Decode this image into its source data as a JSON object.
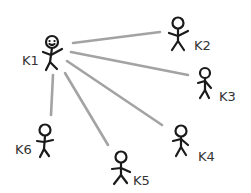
{
  "diagram": {
    "type": "star-network",
    "center_node": "K1",
    "colors": {
      "edge": "#9a9a9a",
      "figure": "#1a1a1a",
      "label": "#333333",
      "background": "#ffffff"
    },
    "nodes": [
      {
        "id": "K1",
        "label": "K1"
      },
      {
        "id": "K2",
        "label": "K2"
      },
      {
        "id": "K3",
        "label": "K3"
      },
      {
        "id": "K4",
        "label": "K4"
      },
      {
        "id": "K5",
        "label": "K5"
      },
      {
        "id": "K6",
        "label": "K6"
      }
    ],
    "edges": [
      {
        "from": "K1",
        "to": "K2"
      },
      {
        "from": "K1",
        "to": "K3"
      },
      {
        "from": "K1",
        "to": "K4"
      },
      {
        "from": "K1",
        "to": "K5"
      },
      {
        "from": "K1",
        "to": "K6"
      }
    ]
  }
}
